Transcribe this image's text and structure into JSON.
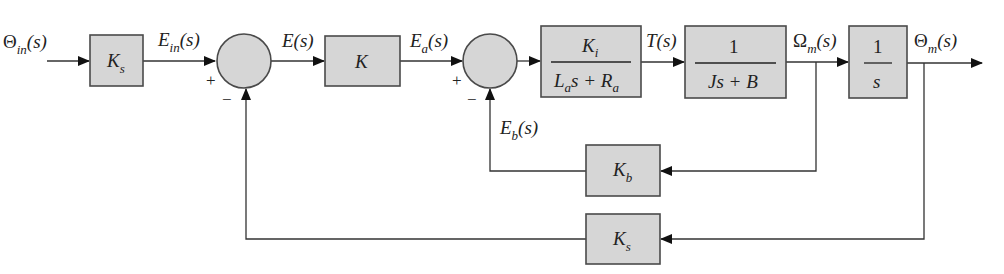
{
  "diagram": {
    "type": "block-diagram",
    "signals": {
      "input": {
        "main": "Θ",
        "sub": "in",
        "arg": "(s)"
      },
      "e_in": {
        "main": "E",
        "sub": "in",
        "arg": "(s)"
      },
      "e": {
        "main": "E",
        "arg": "(s)"
      },
      "e_a": {
        "main": "E",
        "sub": "a",
        "arg": "(s)"
      },
      "torque": {
        "main": "T",
        "arg": "(s)"
      },
      "omega": {
        "main": "Ω",
        "sub": "m",
        "arg": "(s)"
      },
      "output": {
        "main": "Θ",
        "sub": "m",
        "arg": "(s)"
      },
      "e_b": {
        "main": "E",
        "sub": "b",
        "arg": "(s)"
      }
    },
    "blocks": {
      "sensor_in": {
        "main": "K",
        "sub": "s"
      },
      "amplifier": {
        "main": "K"
      },
      "armature": {
        "num_main": "K",
        "num_sub": "i",
        "den_a": "L",
        "den_a_sub": "a",
        "den_b": "s + ",
        "den_c": "R",
        "den_c_sub": "a"
      },
      "mechanical": {
        "num": "1",
        "den": "Js + B"
      },
      "integrator": {
        "num": "1",
        "den": "s"
      },
      "back_emf": {
        "main": "K",
        "sub": "b"
      },
      "sensor_fb": {
        "main": "K",
        "sub": "s"
      }
    },
    "summing_junctions": [
      {
        "id": "sum1",
        "plus": "+",
        "minus": "−"
      },
      {
        "id": "sum2",
        "plus": "+",
        "minus": "−"
      }
    ]
  }
}
